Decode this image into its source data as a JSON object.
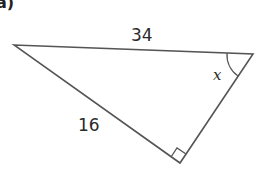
{
  "part_label": "a)",
  "triangle": {
    "side_top": "34",
    "side_left": "16",
    "angle_label": "x",
    "right_angle_marker": true
  },
  "colors": {
    "stroke": "#555555",
    "text": "#2a2a2a"
  }
}
